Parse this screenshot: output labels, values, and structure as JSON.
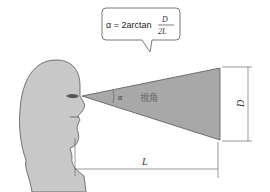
{
  "formula": {
    "lhs": "α = 2arctan",
    "numerator": "D",
    "denominator": "2L"
  },
  "labels": {
    "alpha": "α",
    "visual_angle": "視角",
    "D": "D",
    "L": "L"
  },
  "colors": {
    "head_fill": "#c8c8c8",
    "cone_fill": "#a8a8a8",
    "stroke": "#555555"
  }
}
